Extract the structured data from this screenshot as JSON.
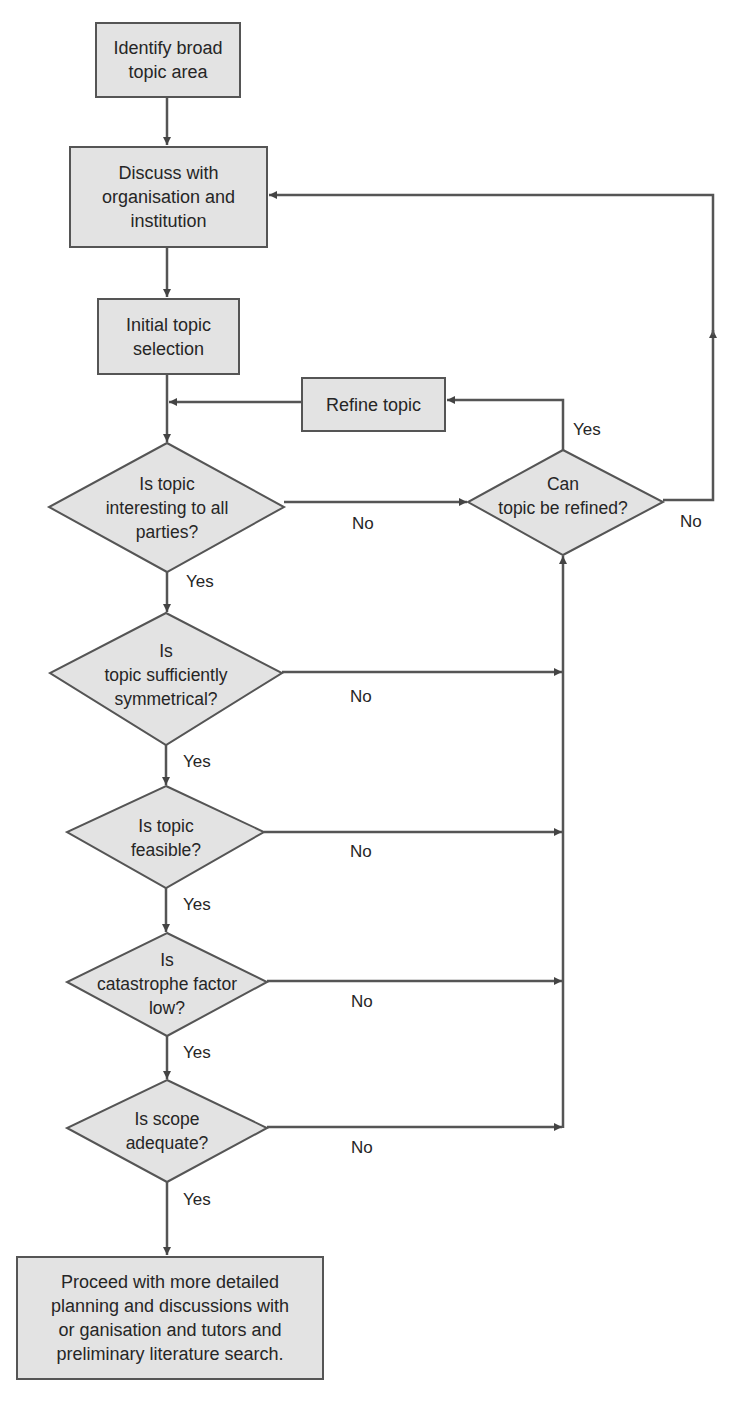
{
  "diagram": {
    "type": "flowchart",
    "colors": {
      "box_fill": "#e3e3e3",
      "box_border": "#555555",
      "line": "#555555",
      "arrowhead": "#444444",
      "text": "#262626"
    },
    "nodes": [
      {
        "id": "identify",
        "shape": "rect",
        "label": "Identify broad\ntopic area"
      },
      {
        "id": "discuss",
        "shape": "rect",
        "label": "Discuss with\norganisation and\ninstitution"
      },
      {
        "id": "initial",
        "shape": "rect",
        "label": "Initial topic\nselection"
      },
      {
        "id": "refine",
        "shape": "rect",
        "label": "Refine topic"
      },
      {
        "id": "q_interesting",
        "shape": "diamond",
        "label": "Is topic\ninteresting to all\nparties?"
      },
      {
        "id": "q_refined",
        "shape": "diamond",
        "label": "Can\ntopic be refined?"
      },
      {
        "id": "q_symmetrical",
        "shape": "diamond",
        "label": "Is\ntopic sufficiently\nsymmetrical?"
      },
      {
        "id": "q_feasible",
        "shape": "diamond",
        "label": "Is topic\nfeasible?"
      },
      {
        "id": "q_catastrophe",
        "shape": "diamond",
        "label": "Is\ncatastrophe factor\nlow?"
      },
      {
        "id": "q_scope",
        "shape": "diamond",
        "label": "Is scope\nadequate?"
      },
      {
        "id": "proceed",
        "shape": "rect",
        "label": "Proceed with more detailed\nplanning and discussions with\nor ganisation and tutors and\npreliminary literature search."
      }
    ],
    "edges": [
      {
        "from": "identify",
        "to": "discuss",
        "label": ""
      },
      {
        "from": "discuss",
        "to": "initial",
        "label": ""
      },
      {
        "from": "initial",
        "to": "q_interesting",
        "label": ""
      },
      {
        "from": "refine",
        "to": "q_interesting",
        "label": ""
      },
      {
        "from": "q_interesting",
        "to": "q_refined",
        "label": "No"
      },
      {
        "from": "q_refined",
        "to": "refine",
        "label": "Yes"
      },
      {
        "from": "q_refined",
        "to": "discuss",
        "label": "No"
      },
      {
        "from": "q_interesting",
        "to": "q_symmetrical",
        "label": "Yes"
      },
      {
        "from": "q_symmetrical",
        "to": "q_refined",
        "label": "No"
      },
      {
        "from": "q_symmetrical",
        "to": "q_feasible",
        "label": "Yes"
      },
      {
        "from": "q_feasible",
        "to": "q_refined",
        "label": "No"
      },
      {
        "from": "q_feasible",
        "to": "q_catastrophe",
        "label": "Yes"
      },
      {
        "from": "q_catastrophe",
        "to": "q_refined",
        "label": "No"
      },
      {
        "from": "q_catastrophe",
        "to": "q_scope",
        "label": "Yes"
      },
      {
        "from": "q_scope",
        "to": "q_refined",
        "label": "No"
      },
      {
        "from": "q_scope",
        "to": "proceed",
        "label": "Yes"
      }
    ],
    "edge_labels": {
      "yes": "Yes",
      "no": "No"
    }
  }
}
